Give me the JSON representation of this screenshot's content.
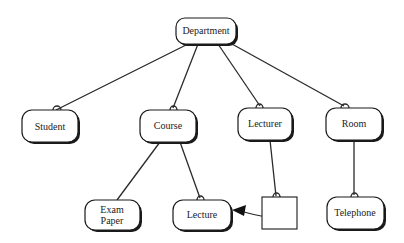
{
  "diagram": {
    "nodes": [
      {
        "id": "department",
        "label": "Department",
        "shape": "rounded"
      },
      {
        "id": "student",
        "label": "Student",
        "shape": "rounded"
      },
      {
        "id": "course",
        "label": "Course",
        "shape": "rounded"
      },
      {
        "id": "lecturer",
        "label": "Lecturer",
        "shape": "rounded"
      },
      {
        "id": "room",
        "label": "Room",
        "shape": "rounded"
      },
      {
        "id": "exam-paper",
        "label_lines": [
          "Exam",
          "Paper"
        ],
        "shape": "rounded"
      },
      {
        "id": "lecture",
        "label": "Lecture",
        "shape": "rounded"
      },
      {
        "id": "association",
        "label": "",
        "shape": "square"
      },
      {
        "id": "telephone",
        "label": "Telephone",
        "shape": "rounded"
      }
    ],
    "edges": [
      {
        "from": "department",
        "to": "student",
        "end_marker": "loop"
      },
      {
        "from": "department",
        "to": "course",
        "end_marker": "loop"
      },
      {
        "from": "department",
        "to": "lecturer",
        "end_marker": "loop"
      },
      {
        "from": "department",
        "to": "room",
        "end_marker": "loop"
      },
      {
        "from": "course",
        "to": "exam-paper",
        "end_marker": "none"
      },
      {
        "from": "course",
        "to": "lecture",
        "end_marker": "loop"
      },
      {
        "from": "lecturer",
        "to": "association",
        "end_marker": "loop"
      },
      {
        "from": "room",
        "to": "telephone",
        "end_marker": "loop"
      },
      {
        "from": "association",
        "to": "lecture",
        "end_marker": "arrow"
      }
    ]
  }
}
